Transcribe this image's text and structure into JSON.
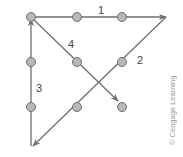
{
  "diagram": {
    "line_color": "#6e6e6e",
    "dot_fill": "#b8b8b8",
    "dot_stroke": "#6e6e6e",
    "dots": [
      {
        "x": 31,
        "y": 17
      },
      {
        "x": 77,
        "y": 17
      },
      {
        "x": 122,
        "y": 17
      },
      {
        "x": 31,
        "y": 62
      },
      {
        "x": 77,
        "y": 62
      },
      {
        "x": 122,
        "y": 62
      },
      {
        "x": 31,
        "y": 107
      },
      {
        "x": 77,
        "y": 107
      },
      {
        "x": 122,
        "y": 107
      }
    ],
    "segments": [
      {
        "label": "1",
        "from": [
          31,
          17
        ],
        "to": [
          166,
          17
        ]
      },
      {
        "label": "2",
        "from": [
          166,
          17
        ],
        "to": [
          33,
          146
        ]
      },
      {
        "label": "3",
        "from": [
          31,
          146
        ],
        "to": [
          31,
          19
        ]
      },
      {
        "label": "4",
        "from": [
          31,
          17
        ],
        "to": [
          118,
          101
        ]
      }
    ],
    "labels": {
      "seg1": "1",
      "seg2": "2",
      "seg3": "3",
      "seg4": "4"
    },
    "credit": "© Cengage Learning"
  }
}
